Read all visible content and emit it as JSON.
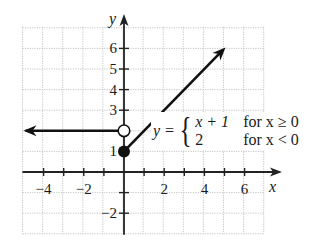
{
  "chart_data": {
    "type": "line",
    "title": "",
    "function": "piecewise",
    "equation": {
      "lhs": "y =",
      "cases": [
        {
          "expr": "x + 1",
          "condition": "for x ≥ 0"
        },
        {
          "expr": "2",
          "condition": "for x < 0"
        }
      ]
    },
    "xlabel": "x",
    "ylabel": "y",
    "xlim": [
      -5,
      7
    ],
    "ylim": [
      -3,
      7
    ],
    "grid": true,
    "x_ticks": [
      -4,
      -3,
      -2,
      -1,
      1,
      2,
      3,
      4,
      5,
      6
    ],
    "x_tick_labels": [
      "−4",
      "−2",
      "2",
      "4",
      "6"
    ],
    "y_ticks": [
      -2,
      -1,
      1,
      2,
      3,
      4,
      5,
      6
    ],
    "y_tick_labels": [
      "−2",
      "1",
      "3",
      "4",
      "5",
      "6"
    ],
    "series": [
      {
        "name": "y = 2 for x < 0",
        "points": [
          [
            -4.9,
            2
          ],
          [
            0,
            2
          ]
        ],
        "start": "arrow",
        "end": "open-circle"
      },
      {
        "name": "y = x + 1 for x ≥ 0",
        "points": [
          [
            0,
            1
          ],
          [
            4.9,
            5.9
          ]
        ],
        "start": "closed-circle",
        "end": "arrow"
      }
    ],
    "markers": [
      {
        "x": 0,
        "y": 2,
        "style": "open"
      },
      {
        "x": 0,
        "y": 1,
        "style": "filled"
      }
    ]
  }
}
